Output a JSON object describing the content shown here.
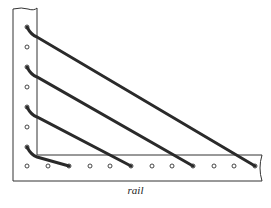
{
  "diagram": {
    "label": "rail",
    "colors": {
      "line": "#333333",
      "strut": "#2a2a2a",
      "background": "#ffffff"
    },
    "post": {
      "holes_y": [
        27,
        47,
        67,
        87,
        107,
        127,
        147
      ]
    },
    "rail": {
      "holes_x": [
        27,
        48,
        69,
        90,
        110,
        131,
        152,
        172,
        193,
        214,
        234,
        255
      ]
    },
    "struts": [
      {
        "from": [
          27,
          27
        ],
        "to": [
          255,
          187
        ]
      },
      {
        "from": [
          27,
          67
        ],
        "to": [
          193,
          187
        ]
      },
      {
        "from": [
          27,
          107
        ],
        "to": [
          131,
          187
        ]
      },
      {
        "from": [
          27,
          147
        ],
        "to": [
          69,
          187
        ]
      }
    ]
  }
}
